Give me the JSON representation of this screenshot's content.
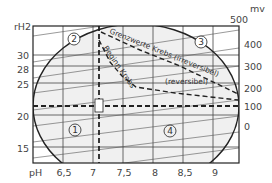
{
  "diagram": {
    "title": "",
    "axes": {
      "left": {
        "label": "rH2",
        "ticks": [
          "30",
          "28",
          "25",
          "20",
          "15"
        ]
      },
      "right": {
        "label": "mv",
        "ticks": [
          "500",
          "400",
          "300",
          "200",
          "100",
          "0"
        ]
      },
      "bottom": {
        "label": "pH",
        "ticks": [
          "6,5",
          "7",
          "7,5",
          "8",
          "8,5",
          "9"
        ]
      }
    },
    "curve_labels": {
      "limit": "Grenzwerte Krebs (irreversibel)",
      "onset": "Beginn Krebs",
      "reversible": "(reversibel)"
    },
    "zones": [
      "1",
      "2",
      "3",
      "4"
    ],
    "colors": {
      "line": "#222222",
      "grid": "#333333",
      "ellipse_fill": "#f0f0f0",
      "background": "#ffffff"
    }
  }
}
